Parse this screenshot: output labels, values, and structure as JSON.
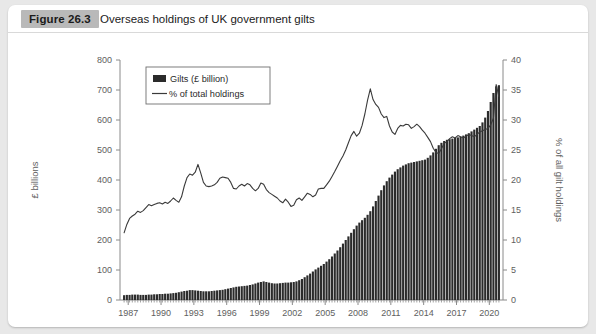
{
  "figure": {
    "badge": "Figure 26.3",
    "title": "Overseas holdings of UK government gilts"
  },
  "chart_data": {
    "type": "bar",
    "title": "Overseas holdings of UK government gilts",
    "xlabel": "",
    "ylabel": "£ billions",
    "y2label": "% of all gilt holdings",
    "ylim": [
      0,
      800
    ],
    "y2lim": [
      0,
      40
    ],
    "yticks": [
      0,
      100,
      200,
      300,
      400,
      500,
      600,
      700,
      800
    ],
    "y2ticks": [
      0,
      5,
      10,
      15,
      20,
      25,
      30,
      35,
      40
    ],
    "xlim": [
      1986.75,
      2021.75
    ],
    "xtick_labels": [
      "1987",
      "1990",
      "1993",
      "1996",
      "1999",
      "2002",
      "2005",
      "2008",
      "2011",
      "2014",
      "2017",
      "2020"
    ],
    "xtick_values": [
      1987,
      1990,
      1993,
      1996,
      1999,
      2002,
      2005,
      2008,
      2011,
      2014,
      2017,
      2020
    ],
    "grid": false,
    "legend_position": "top-left",
    "legend": [
      "Gilts (£ billion)",
      "% of total holdings"
    ],
    "frequency": "quarterly",
    "series": [
      {
        "name": "Gilts (£ billion)",
        "type": "bar",
        "axis": "left",
        "units": "£ billion",
        "color": "#2b2b2b",
        "x": [
          1987.0,
          1987.25,
          1987.5,
          1987.75,
          1988.0,
          1988.25,
          1988.5,
          1988.75,
          1989.0,
          1989.25,
          1989.5,
          1989.75,
          1990.0,
          1990.25,
          1990.5,
          1990.75,
          1991.0,
          1991.25,
          1991.5,
          1991.75,
          1992.0,
          1992.25,
          1992.5,
          1992.75,
          1993.0,
          1993.25,
          1993.5,
          1993.75,
          1994.0,
          1994.25,
          1994.5,
          1994.75,
          1995.0,
          1995.25,
          1995.5,
          1995.75,
          1996.0,
          1996.25,
          1996.5,
          1996.75,
          1997.0,
          1997.25,
          1997.5,
          1997.75,
          1998.0,
          1998.25,
          1998.5,
          1998.75,
          1999.0,
          1999.25,
          1999.5,
          1999.75,
          2000.0,
          2000.25,
          2000.5,
          2000.75,
          2001.0,
          2001.25,
          2001.5,
          2001.75,
          2002.0,
          2002.25,
          2002.5,
          2002.75,
          2003.0,
          2003.25,
          2003.5,
          2003.75,
          2004.0,
          2004.25,
          2004.5,
          2004.75,
          2005.0,
          2005.25,
          2005.5,
          2005.75,
          2006.0,
          2006.25,
          2006.5,
          2006.75,
          2007.0,
          2007.25,
          2007.5,
          2007.75,
          2008.0,
          2008.25,
          2008.5,
          2008.75,
          2009.0,
          2009.25,
          2009.5,
          2009.75,
          2010.0,
          2010.25,
          2010.5,
          2010.75,
          2011.0,
          2011.25,
          2011.5,
          2011.75,
          2012.0,
          2012.25,
          2012.5,
          2012.75,
          2013.0,
          2013.25,
          2013.5,
          2013.75,
          2014.0,
          2014.25,
          2014.5,
          2014.75,
          2015.0,
          2015.25,
          2015.5,
          2015.75,
          2016.0,
          2016.25,
          2016.5,
          2016.75,
          2017.0,
          2017.25,
          2017.5,
          2017.75,
          2018.0,
          2018.25,
          2018.5,
          2018.75,
          2019.0,
          2019.25,
          2019.5,
          2019.75,
          2020.0,
          2020.25,
          2020.5,
          2020.75,
          2021.0,
          2021.25
        ],
        "values": [
          16,
          17,
          17,
          18,
          18,
          18,
          17,
          17,
          17,
          18,
          18,
          19,
          19,
          20,
          20,
          21,
          21,
          22,
          23,
          24,
          26,
          28,
          30,
          31,
          33,
          33,
          32,
          31,
          30,
          29,
          29,
          29,
          30,
          31,
          32,
          33,
          34,
          36,
          38,
          40,
          42,
          44,
          45,
          46,
          47,
          48,
          50,
          52,
          55,
          58,
          60,
          62,
          60,
          58,
          56,
          55,
          55,
          56,
          57,
          58,
          58,
          59,
          60,
          62,
          66,
          70,
          76,
          82,
          88,
          95,
          102,
          108,
          114,
          120,
          128,
          136,
          145,
          155,
          165,
          176,
          188,
          200,
          212,
          224,
          236,
          248,
          258,
          266,
          274,
          284,
          296,
          312,
          330,
          348,
          366,
          382,
          396,
          408,
          418,
          428,
          436,
          442,
          448,
          452,
          456,
          458,
          460,
          462,
          464,
          466,
          468,
          474,
          482,
          492,
          504,
          516,
          524,
          530,
          534,
          536,
          538,
          540,
          542,
          544,
          548,
          552,
          556,
          562,
          568,
          574,
          580,
          592,
          608,
          630,
          660,
          690,
          712,
          716
        ]
      },
      {
        "name": "% of total holdings",
        "type": "line",
        "axis": "right",
        "units": "%",
        "color": "#3a3a3a",
        "x": [
          1987.0,
          1987.25,
          1987.5,
          1987.75,
          1988.0,
          1988.25,
          1988.5,
          1988.75,
          1989.0,
          1989.25,
          1989.5,
          1989.75,
          1990.0,
          1990.25,
          1990.5,
          1990.75,
          1991.0,
          1991.25,
          1991.5,
          1991.75,
          1992.0,
          1992.25,
          1992.5,
          1992.75,
          1993.0,
          1993.25,
          1993.5,
          1993.75,
          1994.0,
          1994.25,
          1994.5,
          1994.75,
          1995.0,
          1995.25,
          1995.5,
          1995.75,
          1996.0,
          1996.25,
          1996.5,
          1996.75,
          1997.0,
          1997.25,
          1997.5,
          1997.75,
          1998.0,
          1998.25,
          1998.5,
          1998.75,
          1999.0,
          1999.25,
          1999.5,
          1999.75,
          2000.0,
          2000.25,
          2000.5,
          2000.75,
          2001.0,
          2001.25,
          2001.5,
          2001.75,
          2002.0,
          2002.25,
          2002.5,
          2002.75,
          2003.0,
          2003.25,
          2003.5,
          2003.75,
          2004.0,
          2004.25,
          2004.5,
          2004.75,
          2005.0,
          2005.25,
          2005.5,
          2005.75,
          2006.0,
          2006.25,
          2006.5,
          2006.75,
          2007.0,
          2007.25,
          2007.5,
          2007.75,
          2008.0,
          2008.25,
          2008.5,
          2008.75,
          2009.0,
          2009.25,
          2009.5,
          2009.75,
          2010.0,
          2010.25,
          2010.5,
          2010.75,
          2011.0,
          2011.25,
          2011.5,
          2011.75,
          2012.0,
          2012.25,
          2012.5,
          2012.75,
          2013.0,
          2013.25,
          2013.5,
          2013.75,
          2014.0,
          2014.25,
          2014.5,
          2014.75,
          2015.0,
          2015.25,
          2015.5,
          2015.75,
          2016.0,
          2016.25,
          2016.5,
          2016.75,
          2017.0,
          2017.25,
          2017.5,
          2017.75,
          2018.0,
          2018.25,
          2018.5,
          2018.75,
          2019.0,
          2019.25,
          2019.5,
          2019.75,
          2020.0,
          2020.25,
          2020.5,
          2020.75,
          2021.0,
          2021.25
        ],
        "values": [
          11.2,
          12.6,
          13.6,
          14.0,
          14.3,
          14.8,
          14.6,
          14.9,
          15.4,
          15.9,
          15.7,
          15.9,
          16.1,
          16.2,
          16.0,
          16.3,
          16.1,
          16.5,
          17.0,
          16.6,
          16.3,
          17.2,
          19.0,
          20.4,
          21.0,
          20.8,
          21.3,
          22.6,
          21.2,
          19.6,
          19.0,
          18.9,
          19.0,
          19.2,
          19.6,
          20.3,
          20.5,
          20.4,
          20.3,
          19.6,
          18.6,
          18.5,
          19.0,
          19.3,
          19.0,
          19.4,
          19.2,
          18.6,
          18.2,
          18.6,
          19.5,
          19.3,
          18.4,
          17.9,
          17.6,
          17.3,
          17.0,
          16.5,
          16.2,
          16.8,
          16.3,
          15.6,
          15.8,
          16.7,
          17.0,
          16.6,
          17.2,
          17.8,
          17.6,
          17.2,
          17.5,
          18.5,
          18.6,
          18.6,
          19.2,
          19.8,
          20.6,
          21.4,
          22.3,
          23.2,
          24.0,
          25.0,
          26.2,
          27.4,
          28.1,
          27.3,
          27.8,
          29.1,
          31.0,
          33.3,
          35.2,
          33.4,
          32.6,
          32.1,
          31.0,
          30.4,
          30.6,
          29.0,
          28.0,
          27.6,
          28.6,
          29.1,
          29.0,
          29.3,
          29.2,
          28.6,
          28.9,
          29.3,
          28.9,
          28.3,
          27.8,
          27.1,
          26.4,
          25.3,
          24.6,
          24.4,
          25.2,
          26.1,
          26.4,
          26.9,
          27.2,
          27.0,
          27.4,
          27.2,
          27.0,
          27.3,
          27.6,
          27.4,
          27.2,
          27.6,
          28.0,
          28.2,
          28.4,
          28.6,
          29.2,
          30.3,
          35.9,
          33.9
        ]
      }
    ]
  }
}
